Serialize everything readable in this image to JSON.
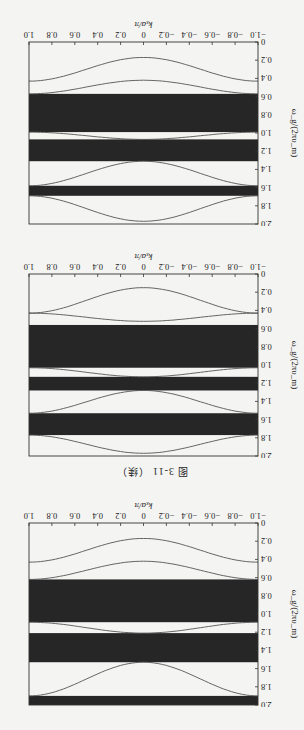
{
  "figure": {
    "caption": "图 3-11 （续）",
    "orientation": "page scanned upside down (rotated 180°)"
  },
  "chart_data": [
    {
      "type": "line",
      "panel_label": "(a)",
      "title": "",
      "xlabel": "k_x a/π",
      "ylabel": "ω_g/(2πυ_m)",
      "xlim": [
        -1.0,
        1.0
      ],
      "ylim": [
        0,
        2.0
      ],
      "xticks": [
        "-1.0",
        "-0.8",
        "-0.6",
        "-0.4",
        "-0.2",
        "0",
        "0.2",
        "0.4",
        "0.6",
        "0.8",
        "1.0"
      ],
      "yticks": [
        "0",
        "0.2",
        "0.4",
        "0.6",
        "0.8",
        "1.0",
        "1.2",
        "1.4",
        "1.6",
        "1.8",
        "2.0"
      ],
      "grid": false,
      "band_gaps": [
        [
          0.56,
          1.03
        ],
        [
          1.13,
          1.28
        ],
        [
          1.53,
          1.77
        ]
      ],
      "series": [
        {
          "name": "band 1",
          "x": [
            -1,
            -0.5,
            0,
            0.5,
            1
          ],
          "values": [
            0.43,
            0.28,
            0.15,
            0.28,
            0.43
          ]
        },
        {
          "name": "band 2",
          "x": [
            -1,
            -0.5,
            0,
            0.5,
            1
          ],
          "values": [
            0.43,
            0.47,
            0.52,
            0.47,
            0.43
          ]
        },
        {
          "name": "band 3",
          "x": [
            -1,
            -0.5,
            0,
            0.5,
            1
          ],
          "values": [
            1.03,
            1.08,
            1.13,
            1.08,
            1.03
          ]
        },
        {
          "name": "band 4",
          "x": [
            -1,
            -0.5,
            0,
            0.5,
            1
          ],
          "values": [
            1.53,
            1.4,
            1.28,
            1.4,
            1.53
          ]
        },
        {
          "name": "band 5",
          "x": [
            -1,
            -0.5,
            0,
            0.5,
            1
          ],
          "values": [
            1.77,
            1.88,
            1.97,
            1.88,
            1.77
          ]
        }
      ]
    },
    {
      "type": "line",
      "panel_label": "(b)",
      "title": "",
      "xlabel": "k_x a/π",
      "ylabel": "ω_g/(2πυ_m)",
      "xlim": [
        -1.0,
        1.0
      ],
      "ylim": [
        0,
        2.0
      ],
      "xticks": [
        "-1.0",
        "-0.8",
        "-0.6",
        "-0.4",
        "-0.2",
        "0",
        "0.2",
        "0.4",
        "0.6",
        "0.8",
        "1.0"
      ],
      "yticks": [
        "0",
        "0.2",
        "0.4",
        "0.6",
        "0.8",
        "1.0",
        "1.2",
        "1.4",
        "1.6",
        "1.8",
        "2.0"
      ],
      "grid": false,
      "band_gaps": [
        [
          0.57,
          0.99
        ],
        [
          1.07,
          1.31
        ],
        [
          1.58,
          1.69
        ]
      ],
      "series": [
        {
          "name": "band 1",
          "x": [
            -1,
            -0.5,
            0,
            0.5,
            1
          ],
          "values": [
            0.43,
            0.3,
            0.17,
            0.3,
            0.43
          ]
        },
        {
          "name": "band 2",
          "x": [
            -1,
            -0.5,
            0,
            0.5,
            1
          ],
          "values": [
            0.57,
            0.5,
            0.42,
            0.5,
            0.57
          ]
        },
        {
          "name": "band 3",
          "x": [
            -1,
            -0.5,
            0,
            0.5,
            1
          ],
          "values": [
            0.99,
            1.03,
            1.07,
            1.03,
            0.99
          ]
        },
        {
          "name": "band 4",
          "x": [
            -1,
            -0.5,
            0,
            0.5,
            1
          ],
          "values": [
            1.58,
            1.45,
            1.31,
            1.45,
            1.58
          ]
        },
        {
          "name": "band 5",
          "x": [
            -1,
            -0.5,
            0,
            0.5,
            1
          ],
          "values": [
            1.69,
            1.85,
            1.97,
            1.85,
            1.69
          ]
        }
      ]
    },
    {
      "type": "line",
      "panel_label": "(c)",
      "title": "",
      "xlabel": "k_x a/π",
      "ylabel": "ω_g/(2πυ_m)",
      "xlim": [
        -1.0,
        1.0
      ],
      "ylim": [
        0,
        2.0
      ],
      "xticks": [
        "-1.0",
        "-0.8",
        "-0.6",
        "-0.4",
        "-0.2",
        "0",
        "0.2",
        "0.4",
        "0.6",
        "0.8",
        "1.0"
      ],
      "yticks": [
        "0",
        "0.2",
        "0.4",
        "0.6",
        "0.8",
        "1.0",
        "1.2",
        "1.4",
        "1.6",
        "1.8",
        "2.0"
      ],
      "grid": false,
      "band_gaps": [
        [
          0.62,
          1.09
        ],
        [
          1.21,
          1.53
        ],
        [
          1.9,
          2.0
        ]
      ],
      "series": [
        {
          "name": "band 1",
          "x": [
            -1,
            -0.5,
            0,
            0.5,
            1
          ],
          "values": [
            0.43,
            0.3,
            0.17,
            0.3,
            0.43
          ]
        },
        {
          "name": "band 2",
          "x": [
            -1,
            -0.5,
            0,
            0.5,
            1
          ],
          "values": [
            0.62,
            0.52,
            0.42,
            0.52,
            0.62
          ]
        },
        {
          "name": "band 3",
          "x": [
            -1,
            -0.5,
            0,
            0.5,
            1
          ],
          "values": [
            1.09,
            1.15,
            1.21,
            1.15,
            1.09
          ]
        },
        {
          "name": "band 4",
          "x": [
            -1,
            -0.5,
            0,
            0.5,
            1
          ],
          "values": [
            1.9,
            1.72,
            1.53,
            1.72,
            1.9
          ]
        }
      ]
    }
  ],
  "labels": {
    "panel_a": "(a)",
    "panel_b": "(b)",
    "panel_c": "(c)",
    "xlabel": "kₓa/π",
    "ylabel": "ω_g/(2πυ_m)"
  }
}
